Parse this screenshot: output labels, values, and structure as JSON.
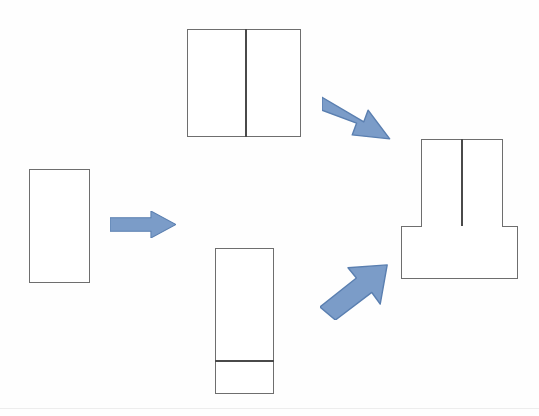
{
  "figure": {
    "background_color": "#fefefe",
    "outline_color": "#6e6e6e",
    "divider_color": "#4a4a4a",
    "arrow_fill_color": "#7b9cc8",
    "arrow_stroke_color": "#5a7fb0"
  },
  "nodes": [
    {
      "id": "blank",
      "name": "source-blank-rectangle",
      "label": "",
      "shape": "rectangle",
      "x": 29,
      "y": 169,
      "width": 61,
      "height": 114,
      "dividers": []
    },
    {
      "id": "wide-split-part",
      "name": "wide-split-rectangle",
      "label": "",
      "shape": "rectangle",
      "x": 187,
      "y": 29,
      "width": 114,
      "height": 108,
      "dividers": [
        {
          "orientation": "vertical",
          "offset": 58
        }
      ]
    },
    {
      "id": "tall-stepped-part",
      "name": "tall-stepped-rectangle",
      "label": "",
      "shape": "rectangle",
      "x": 215,
      "y": 248,
      "width": 59,
      "height": 146,
      "dividers": [
        {
          "orientation": "horizontal",
          "offset": 112
        }
      ]
    },
    {
      "id": "assembly-upper",
      "name": "assembly-upper-block",
      "label": "",
      "shape": "rectangle",
      "x": 421,
      "y": 139,
      "width": 82,
      "height": 88,
      "dividers": [
        {
          "orientation": "vertical",
          "offset": 40
        }
      ]
    },
    {
      "id": "assembly-base",
      "name": "assembly-base-block",
      "label": "",
      "shape": "rectangle",
      "x": 401,
      "y": 226,
      "width": 117,
      "height": 53,
      "dividers": []
    }
  ],
  "arrows": [
    {
      "id": "arrow-right",
      "name": "arrow-blank-to-parts",
      "direction": "right",
      "angle_deg": 0,
      "x": 110,
      "y": 211,
      "width": 66,
      "height": 27,
      "from": "blank",
      "to": "wide-split-part"
    },
    {
      "id": "arrow-down-right",
      "name": "arrow-wide-part-to-assembly",
      "direction": "down-right",
      "angle_deg": 40,
      "x": 322,
      "y": 92,
      "width": 72,
      "height": 52,
      "from": "wide-split-part",
      "to": "assembly-upper"
    },
    {
      "id": "arrow-up-right",
      "name": "arrow-tall-part-to-assembly",
      "direction": "up-right",
      "angle_deg": -42,
      "x": 320,
      "y": 262,
      "width": 70,
      "height": 58,
      "from": "tall-stepped-part",
      "to": "assembly-base"
    }
  ],
  "artifacts": {
    "scan_line_y": 408,
    "scan_line_color": "#ededed"
  }
}
